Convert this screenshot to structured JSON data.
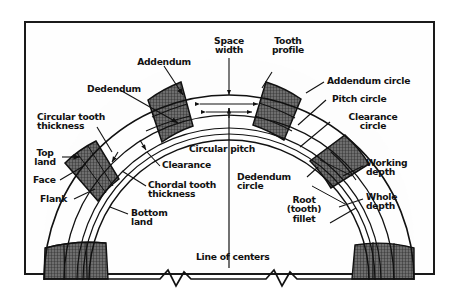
{
  "figure": {
    "type": "engineering-diagram",
    "background": "#ffffff",
    "frame_color": "#1a1a1a",
    "line_color": "#111111",
    "tooth_fill": "#6e6e6e",
    "hatch_color": "#3a3a3a",
    "band_fill": "#f2f2f2"
  },
  "labels": {
    "addendum": "Addendum",
    "space_width": "Space\nwidth",
    "tooth_profile": "Tooth\nprofile",
    "addendum_circle": "Addendum circle",
    "pitch_circle": "Pitch circle",
    "clearance_circle": "Clearance\ncircle",
    "dedendum": "Dedendum",
    "circular_tooth_thickness": "Circular tooth\nthickness",
    "top_land": "Top\nland",
    "face": "Face",
    "flank": "Flank",
    "circular_pitch": "Circular pitch",
    "clearance": "Clearance",
    "chordal_tooth_thickness": "Chordal tooth\nthickness",
    "bottom_land": "Bottom\nland",
    "dedendum_circle": "Dedendum\ncircle",
    "root_tooth_fillet": "Root\n(tooth)\nfillet",
    "working_depth": "Working\ndepth",
    "whole_depth": "Whole\ndepth",
    "line_of_centers": "Line of centers"
  }
}
